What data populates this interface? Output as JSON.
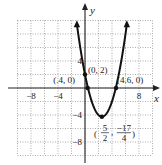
{
  "chart_data": {
    "type": "line",
    "title": "",
    "xlabel": "x",
    "ylabel": "y",
    "xlim": [
      -10,
      10
    ],
    "ylim": [
      -10,
      10
    ],
    "grid": true,
    "grid_step": 2,
    "x_ticks": [
      {
        "value": -8,
        "label": "−8"
      },
      {
        "value": -4,
        "label": "−4"
      },
      {
        "value": 8,
        "label": "8"
      }
    ],
    "y_ticks": [
      {
        "value": 4,
        "label": "4"
      },
      {
        "value": -4,
        "label": "−4"
      },
      {
        "value": -8,
        "label": "−8"
      }
    ],
    "series": [
      {
        "name": "y = x^2 - 5x + 2",
        "equation": {
          "a": 1,
          "b": -5,
          "c": 2
        },
        "x_range": [
          -1.2,
          6.2
        ],
        "arrows_at_ends": true
      }
    ],
    "points": [
      {
        "name": "y-intercept",
        "x": 0,
        "y": 2,
        "label": "(0, 2)"
      },
      {
        "name": "left-root",
        "x": 0.4,
        "y": 0,
        "label": "(.4, 0)"
      },
      {
        "name": "right-root",
        "x": 4.6,
        "y": 0,
        "label": "(4.6, 0)"
      },
      {
        "name": "vertex",
        "x": 2.5,
        "y": -4.25,
        "label_num1": "5",
        "label_den1": "2",
        "label_num2": "−17",
        "label_den2": "4"
      }
    ]
  }
}
